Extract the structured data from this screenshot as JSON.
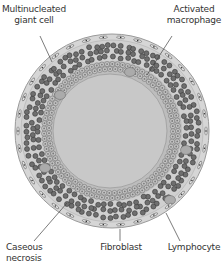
{
  "diagram": {
    "labels": {
      "giant_cell_line1": "Multinucleated",
      "giant_cell_line2": "giant cell",
      "macrophage_line1": "Activated",
      "macrophage_line2": "macrophage",
      "necrosis_line1": "Caseous",
      "necrosis_line2": "necrosis",
      "fibroblast": "Fibroblast",
      "lymphocyte": "Lymphocyte"
    },
    "colors": {
      "outer_capsule": "#d4d4d4",
      "capsule_edge": "#9a9a9a",
      "lymphocyte_fill": "#6e6e6e",
      "lymphocyte_edge": "#3a3a3a",
      "macrophage_fill": "#c2c2c2",
      "macrophage_edge": "#6a6a6a",
      "necrosis_fill": "#c8c8c8",
      "leader_line": "#444444"
    }
  }
}
